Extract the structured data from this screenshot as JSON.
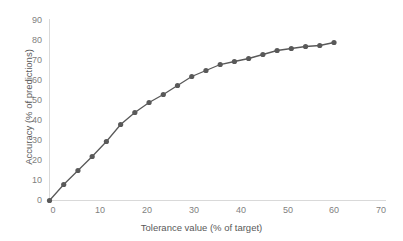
{
  "chart_data": {
    "type": "line",
    "title": "",
    "subtitle": "",
    "xlabel": "Tolerance value (% of target)",
    "ylabel": "Accuracy (% of predictions)",
    "xlim": [
      0,
      70
    ],
    "ylim": [
      0,
      90
    ],
    "xticks": [
      0,
      10,
      20,
      30,
      40,
      50,
      60,
      70
    ],
    "yticks": [
      0,
      10,
      20,
      30,
      40,
      50,
      60,
      70,
      80,
      90
    ],
    "grid": false,
    "legend": null,
    "legend_position": "none",
    "marker": "circle",
    "series": [
      {
        "name": "Accuracy",
        "color": "#595959",
        "x": [
          0,
          3,
          6,
          9,
          12,
          15,
          18,
          21,
          24,
          27,
          30,
          33,
          36,
          39,
          42,
          45,
          48,
          51,
          54,
          57,
          60
        ],
        "values": [
          0,
          8,
          15,
          22,
          29.5,
          38,
          44,
          49,
          53,
          57.5,
          62,
          65,
          68,
          69.5,
          71,
          73,
          75,
          76,
          77,
          77.5,
          79
        ]
      }
    ],
    "annotations": []
  },
  "axes": {
    "x_tick_labels": [
      "0",
      "10",
      "20",
      "30",
      "40",
      "50",
      "60",
      "70"
    ],
    "y_tick_labels": [
      "0",
      "10",
      "20",
      "30",
      "40",
      "50",
      "60",
      "70",
      "80",
      "90"
    ],
    "x_title": "Tolerance value (% of target)",
    "y_title": "Accuracy (% of predictions)"
  },
  "style": {
    "axis_line_color": "#d9d9d9",
    "tick_label_color": "#7f7f7f",
    "series_color": "#595959",
    "background": "#ffffff"
  }
}
